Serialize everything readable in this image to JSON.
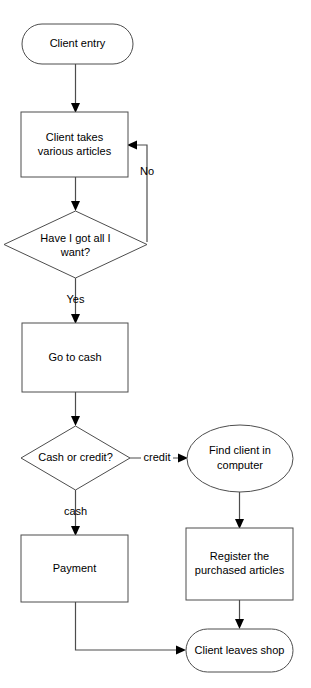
{
  "diagram": {
    "type": "flowchart",
    "background_color": "#ffffff",
    "stroke_color": "#4d4d4d",
    "text_color": "#000000",
    "nodes": [
      {
        "id": "client-entry",
        "shape": "rounded-rectangle",
        "label": "Client entry",
        "lines": [
          "Client entry"
        ]
      },
      {
        "id": "client-takes-articles",
        "shape": "rectangle",
        "label": "Client takes various articles",
        "lines": [
          "Client takes",
          "various articles"
        ]
      },
      {
        "id": "have-i-got-all",
        "shape": "diamond",
        "label": "Have I got all I want?",
        "lines": [
          "Have I got all I",
          "want?"
        ]
      },
      {
        "id": "go-to-cash",
        "shape": "rectangle",
        "label": "Go to cash",
        "lines": [
          "Go to cash"
        ]
      },
      {
        "id": "cash-or-credit",
        "shape": "diamond",
        "label": "Cash or credit?",
        "lines": [
          "Cash or credit?"
        ]
      },
      {
        "id": "find-client-in-computer",
        "shape": "ellipse",
        "label": "Find client in computer",
        "lines": [
          "Find client in",
          "computer"
        ]
      },
      {
        "id": "payment",
        "shape": "rectangle",
        "label": "Payment",
        "lines": [
          "Payment"
        ]
      },
      {
        "id": "register-purchased-articles",
        "shape": "rectangle",
        "label": "Register the purchased articles",
        "lines": [
          "Register the",
          "purchased articles"
        ]
      },
      {
        "id": "client-leaves-shop",
        "shape": "rounded-rectangle",
        "label": "Client leaves shop",
        "lines": [
          "Client leaves shop"
        ]
      }
    ],
    "edge_labels": {
      "no": "No",
      "yes": "Yes",
      "credit": "credit",
      "cash": "cash"
    }
  }
}
